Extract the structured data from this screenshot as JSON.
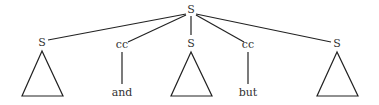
{
  "tree": {
    "root": {
      "label": "S",
      "x": 191,
      "y": 12
    },
    "children": [
      {
        "label": "S",
        "x": 42,
        "y": 43,
        "type": "triangle"
      },
      {
        "label": "cc",
        "x": 122,
        "y": 46,
        "type": "terminal",
        "word": "and"
      },
      {
        "label": "S",
        "x": 191,
        "y": 43,
        "type": "triangle"
      },
      {
        "label": "cc",
        "x": 248,
        "y": 46,
        "type": "terminal",
        "word": "but"
      },
      {
        "label": "S",
        "x": 337,
        "y": 43,
        "type": "triangle"
      }
    ]
  }
}
